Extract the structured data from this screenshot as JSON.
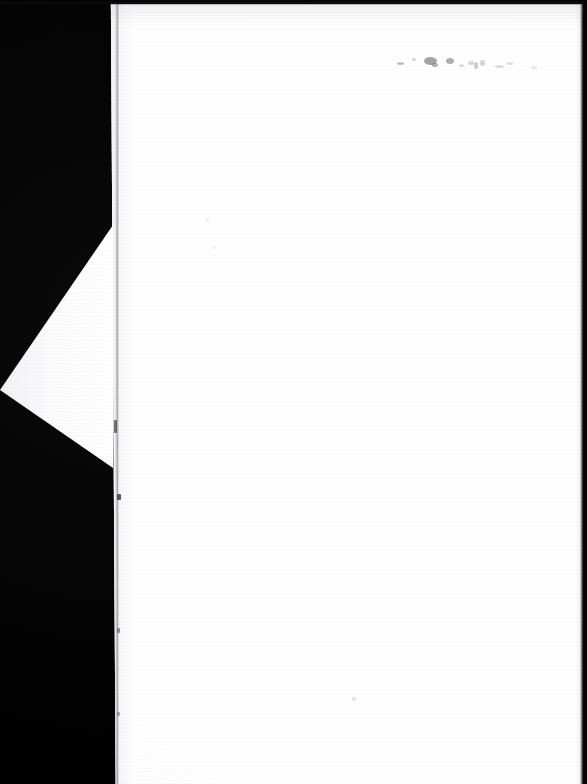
{
  "document": {
    "kind": "scanned-page-photograph",
    "page_state": "blank",
    "visible_text": "",
    "caption": "",
    "background_color": "#000000",
    "page_color": "#ffffff",
    "page_tone_color": "#f6f6f8",
    "crease_color": "#787882",
    "speck_color": "#3c3c44"
  },
  "geometry": {
    "canvas_width": 587,
    "canvas_height": 784,
    "page_left_top": 108,
    "page_left_bottom": 116,
    "page_right": 587,
    "page_top": 4,
    "page_bottom": 784,
    "fold_apex_top_x": 113,
    "fold_apex_top_y": 225,
    "fold_tip_x": 0,
    "fold_tip_y": 390,
    "fold_apex_bottom_x": 113,
    "fold_apex_bottom_y": 468,
    "crease_x": 116,
    "edge_strip_top_height": 5,
    "edge_strip_right_width": 7
  },
  "marks": {
    "top_smudges": [
      {
        "x": 397,
        "y": 62,
        "w": 7,
        "h": 3,
        "opacity": 0.3
      },
      {
        "x": 412,
        "y": 58,
        "w": 4,
        "h": 3,
        "opacity": 0.22
      },
      {
        "x": 424,
        "y": 57,
        "w": 13,
        "h": 8,
        "opacity": 0.46
      },
      {
        "x": 432,
        "y": 63,
        "w": 6,
        "h": 4,
        "opacity": 0.38
      },
      {
        "x": 446,
        "y": 58,
        "w": 8,
        "h": 6,
        "opacity": 0.4
      },
      {
        "x": 459,
        "y": 64,
        "w": 5,
        "h": 3,
        "opacity": 0.18
      },
      {
        "x": 468,
        "y": 61,
        "w": 6,
        "h": 4,
        "opacity": 0.2
      },
      {
        "x": 474,
        "y": 62,
        "w": 4,
        "h": 7,
        "opacity": 0.26
      },
      {
        "x": 480,
        "y": 60,
        "w": 5,
        "h": 6,
        "opacity": 0.22
      },
      {
        "x": 495,
        "y": 65,
        "w": 9,
        "h": 3,
        "opacity": 0.16
      },
      {
        "x": 506,
        "y": 62,
        "w": 7,
        "h": 3,
        "opacity": 0.14
      },
      {
        "x": 531,
        "y": 66,
        "w": 6,
        "h": 3,
        "opacity": 0.1
      }
    ],
    "crease_marks": [
      {
        "x": 114,
        "y": 420,
        "w": 3,
        "h": 13,
        "opacity": 0.7
      },
      {
        "x": 117,
        "y": 494,
        "w": 4,
        "h": 6,
        "opacity": 0.85
      },
      {
        "x": 117,
        "y": 628,
        "w": 3,
        "h": 5,
        "opacity": 0.55
      },
      {
        "x": 117,
        "y": 712,
        "w": 3,
        "h": 4,
        "opacity": 0.4
      }
    ],
    "page_specks": [
      {
        "x": 352,
        "y": 697,
        "w": 4,
        "h": 4,
        "opacity": 0.14
      },
      {
        "x": 206,
        "y": 219,
        "w": 3,
        "h": 3,
        "opacity": 0.1
      },
      {
        "x": 213,
        "y": 246,
        "w": 3,
        "h": 3,
        "opacity": 0.09
      }
    ]
  }
}
